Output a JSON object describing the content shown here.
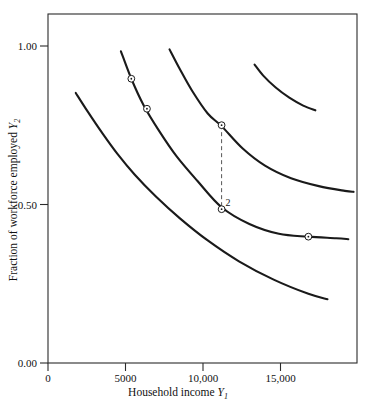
{
  "chart_data": {
    "type": "line",
    "title": "",
    "subtitle": "",
    "xlabel": "Household income Y1",
    "xlabel_main": "Household income",
    "xlabel_var": "Y",
    "xlabel_var_sub": "1",
    "ylabel": "Fraction of workforce employed Y2",
    "ylabel_main": "Fraction of workforce employed",
    "ylabel_var": "Y",
    "ylabel_var_sub": "2",
    "xlim": [
      0,
      17800
    ],
    "ylim": [
      0.0,
      1.105
    ],
    "grid": false,
    "legend": "none",
    "xticks": [
      0,
      5000,
      10000,
      15000
    ],
    "xticklabels": [
      "0",
      "5000",
      "10,000",
      "15,000"
    ],
    "yticks": [
      0.0,
      0.5,
      1.0
    ],
    "yticklabels": [
      "0.00",
      "0.50",
      "1.00"
    ],
    "frame": "box",
    "series": [
      {
        "name": "curve-1",
        "x": [
          1600,
          2300,
          3100,
          4000,
          5000,
          6200,
          7600,
          9200,
          11000,
          13000,
          15000,
          16100
        ],
        "y": [
          0.855,
          0.795,
          0.73,
          0.662,
          0.596,
          0.528,
          0.458,
          0.388,
          0.322,
          0.264,
          0.219,
          0.202
        ]
      },
      {
        "name": "curve-2",
        "x": [
          4200,
          4800,
          5500,
          6400,
          7400,
          8600,
          10000,
          11600,
          13300,
          15000,
          16600,
          17300
        ],
        "y": [
          0.987,
          0.9,
          0.817,
          0.735,
          0.655,
          0.577,
          0.493,
          0.44,
          0.409,
          0.4,
          0.395,
          0.392
        ]
      },
      {
        "name": "curve-3",
        "x": [
          7000,
          7600,
          8300,
          9200,
          10000,
          11200,
          12500,
          14000,
          15600,
          17100,
          17600
        ],
        "y": [
          0.993,
          0.93,
          0.862,
          0.79,
          0.75,
          0.68,
          0.625,
          0.585,
          0.56,
          0.545,
          0.542
        ]
      },
      {
        "name": "curve-4",
        "x": [
          11900,
          12400,
          13100,
          13900,
          14700,
          15400
        ],
        "y": [
          0.945,
          0.91,
          0.873,
          0.84,
          0.815,
          0.8
        ]
      }
    ],
    "markers": [
      {
        "name": "marker-a",
        "x": 4800,
        "y": 0.9,
        "curve": "curve-2"
      },
      {
        "name": "marker-b",
        "x": 5700,
        "y": 0.805,
        "curve": "curve-2"
      },
      {
        "name": "marker-c",
        "x": 10000,
        "y": 0.753,
        "curve": "curve-3"
      },
      {
        "name": "marker-d",
        "x": 10000,
        "y": 0.487,
        "curve": "curve-2"
      },
      {
        "name": "marker-e",
        "x": 15000,
        "y": 0.4,
        "curve": "curve-2"
      }
    ],
    "annotations": [
      {
        "name": "vertical-gap",
        "type": "dashed-segment",
        "x": 10000,
        "y_top": 0.753,
        "y_bottom": 0.487,
        "label": "2"
      }
    ]
  }
}
